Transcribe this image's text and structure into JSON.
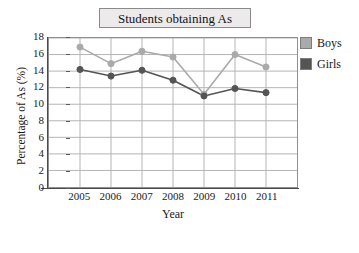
{
  "chart_data": {
    "type": "line",
    "title": "Students obtaining As",
    "xlabel": "Year",
    "ylabel": "Percentage of  As (%)",
    "categories": [
      "2005",
      "2006",
      "2007",
      "2008",
      "2009",
      "2010",
      "2011"
    ],
    "x": [
      2005,
      2006,
      2007,
      2008,
      2009,
      2010,
      2011
    ],
    "series": [
      {
        "name": "Boys",
        "color": "#aaaaaa",
        "values": [
          16.9,
          14.9,
          16.4,
          15.7,
          11.2,
          16.0,
          14.5
        ]
      },
      {
        "name": "Girls",
        "color": "#555555",
        "values": [
          14.2,
          13.4,
          14.1,
          12.9,
          11.0,
          11.9,
          11.4
        ]
      }
    ],
    "ylim": [
      0,
      18
    ],
    "ytick_values": [
      0,
      2,
      4,
      6,
      8,
      10,
      12,
      14,
      16,
      18
    ],
    "ytick_labels": [
      "0",
      "2",
      "4",
      "6",
      "8",
      "10",
      "12",
      "14",
      "16",
      "18"
    ],
    "grid": "both",
    "legend_position": "right-top",
    "marker": "circle"
  },
  "legend": {
    "entries": [
      {
        "label": "Boys",
        "color": "#aaaaaa"
      },
      {
        "label": "Girls",
        "color": "#555555"
      }
    ]
  },
  "colors": {
    "boys": "#aaaaaa",
    "girls": "#555555",
    "grid": "#b4b4b4",
    "axis": "#4a4a4a",
    "title_fill": "#eceaea",
    "title_border": "#8a8a8a",
    "background": "#ffffff"
  }
}
